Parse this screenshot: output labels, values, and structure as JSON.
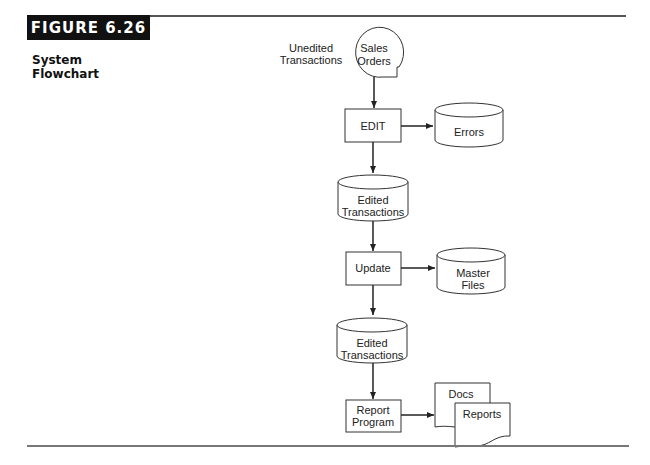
{
  "figure": {
    "label": "FIGURE 6.26",
    "title_line1": "System",
    "title_line2": "Flowchart"
  },
  "flowchart": {
    "input_annotation": [
      "Unedited",
      "Transactions"
    ],
    "nodes": {
      "sales_orders": {
        "type": "document-input",
        "lines": [
          "Sales",
          "Orders"
        ]
      },
      "edit": {
        "type": "process",
        "lines": [
          "EDIT"
        ]
      },
      "errors": {
        "type": "storage",
        "lines": [
          "Errors"
        ]
      },
      "edited_transactions_1": {
        "type": "storage",
        "lines": [
          "Edited",
          "Transactions"
        ]
      },
      "update": {
        "type": "process",
        "lines": [
          "Update"
        ]
      },
      "master_files": {
        "type": "storage",
        "lines": [
          "Master",
          "Files"
        ]
      },
      "edited_transactions_2": {
        "type": "storage",
        "lines": [
          "Edited",
          "Transactions"
        ]
      },
      "report_program": {
        "type": "process",
        "lines": [
          "Report",
          "Program"
        ]
      },
      "docs": {
        "type": "document",
        "lines": [
          "Docs"
        ]
      },
      "reports": {
        "type": "document",
        "lines": [
          "Reports"
        ]
      }
    },
    "edges": [
      [
        "sales_orders",
        "edit"
      ],
      [
        "edit",
        "errors"
      ],
      [
        "edit",
        "edited_transactions_1"
      ],
      [
        "edited_transactions_1",
        "update"
      ],
      [
        "update",
        "master_files"
      ],
      [
        "update",
        "edited_transactions_2"
      ],
      [
        "edited_transactions_2",
        "report_program"
      ],
      [
        "report_program",
        "docs"
      ]
    ]
  }
}
